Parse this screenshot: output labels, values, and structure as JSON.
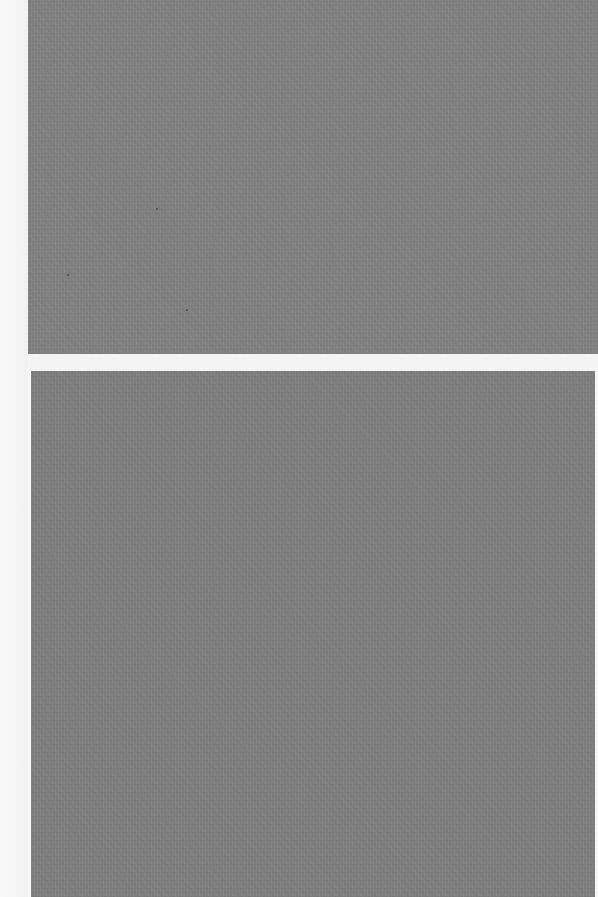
{
  "scene": {
    "description": "Two textured gray sheets on a white background",
    "background_color": "#f7f7f7",
    "sheets": [
      {
        "name": "top",
        "color": "#7f7f7f"
      },
      {
        "name": "bottom",
        "color": "#7d7d7d"
      }
    ],
    "gap_color": "#f4f4f4"
  }
}
